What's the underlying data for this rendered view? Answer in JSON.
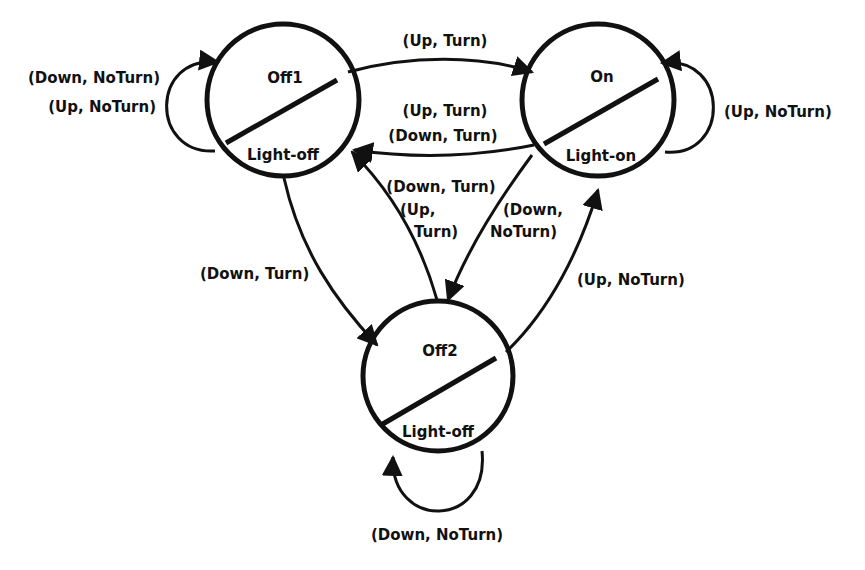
{
  "diagram": {
    "type": "state-machine (Moore)",
    "states": [
      {
        "id": "off1",
        "name": "Off1",
        "output": "Light-off"
      },
      {
        "id": "on",
        "name": "On",
        "output": "Light-on"
      },
      {
        "id": "off2",
        "name": "Off2",
        "output": "Light-off"
      }
    ],
    "transitions": [
      {
        "from": "off1",
        "to": "off1",
        "labels": [
          "(Down, NoTurn)",
          "(Up, NoTurn)"
        ]
      },
      {
        "from": "off1",
        "to": "on",
        "labels": [
          "(Up, Turn)"
        ]
      },
      {
        "from": "on",
        "to": "off1",
        "labels": [
          "(Up, Turn)",
          "(Down, Turn)"
        ]
      },
      {
        "from": "on",
        "to": "on",
        "labels": [
          "(Up, NoTurn)"
        ]
      },
      {
        "from": "off2",
        "to": "off1",
        "labels": [
          "(Down, Turn)",
          "(Up,",
          "Turn)"
        ]
      },
      {
        "from": "on",
        "to": "off2",
        "labels": [
          "(Down,",
          "NoTurn)"
        ]
      },
      {
        "from": "off1",
        "to": "off2",
        "labels": [
          "(Down, Turn)"
        ]
      },
      {
        "from": "off2",
        "to": "on",
        "labels": [
          "(Up, NoTurn)"
        ]
      },
      {
        "from": "off2",
        "to": "off2",
        "labels": [
          "(Down, NoTurn)"
        ]
      }
    ]
  },
  "colors": {
    "ink": "#111111",
    "background": "#ffffff"
  }
}
